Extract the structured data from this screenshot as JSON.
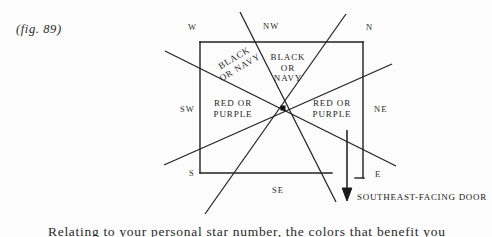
{
  "figure": {
    "caption": "(fig. 89)"
  },
  "diagram": {
    "type": "bagua-direction-compass-over-floorplan",
    "center_point": {
      "x": 283,
      "y": 108
    },
    "room_rect": {
      "x": 200,
      "y": 42,
      "width": 163,
      "height": 131
    },
    "direction_labels": [
      {
        "name": "W",
        "text": "W",
        "x": 190,
        "y": 27
      },
      {
        "name": "NW",
        "text": "NW",
        "x": 265,
        "y": 26
      },
      {
        "name": "N",
        "text": "N",
        "x": 367,
        "y": 27
      },
      {
        "name": "NE",
        "text": "NE",
        "x": 376,
        "y": 108
      },
      {
        "name": "E",
        "text": "E",
        "x": 376,
        "y": 174
      },
      {
        "name": "SE",
        "text": "SE",
        "x": 274,
        "y": 188
      },
      {
        "name": "S",
        "text": "S",
        "x": 190,
        "y": 173
      },
      {
        "name": "SW",
        "text": "SW",
        "x": 183,
        "y": 108
      }
    ],
    "zone_labels": [
      {
        "name": "nw-black-or-navy",
        "lines": [
          "BLACK",
          "OR NAVY"
        ],
        "rotated": true
      },
      {
        "name": "n-black-or-navy",
        "lines": [
          "BLACK",
          "OR",
          "NAVY"
        ],
        "rotated": false
      },
      {
        "name": "sw-red-or-purple",
        "lines": [
          "RED OR",
          "PURPLE"
        ],
        "rotated": false
      },
      {
        "name": "ne-red-or-purple",
        "lines": [
          "RED OR",
          "PURPLE"
        ],
        "rotated": false
      }
    ],
    "door_arrow": {
      "caption": "SOUTHEAST-FACING DOOR",
      "shaft_x": 347,
      "shaft_top_y": 130,
      "shaft_bottom_y": 198
    },
    "colors": {
      "ink": "#1a1a1a",
      "paper": "#fcfcfc",
      "line": "#222222"
    }
  },
  "page_body": {
    "partial_line": "Relating to your personal star number, the colors that benefit you"
  }
}
